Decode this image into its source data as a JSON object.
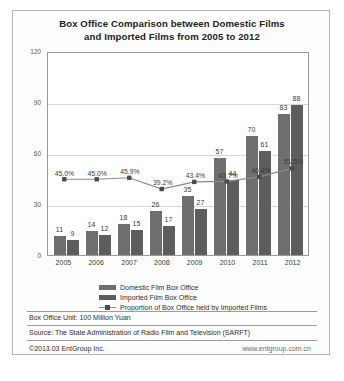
{
  "chart_data": {
    "type": "bar",
    "title": "Box Office Comparison between Domestic Films and Imported Films from 2005 to 2012",
    "title_line1": "Box Office Comparison between Domestic Films",
    "title_line2": "and Imported Films from 2005 to 2012",
    "categories": [
      "2005",
      "2006",
      "2007",
      "2008",
      "2009",
      "2010",
      "2011",
      "2012"
    ],
    "series": [
      {
        "name": "Domestic Film Box Office",
        "type": "bar",
        "values": [
          11,
          14,
          18,
          26,
          35,
          57,
          70,
          83
        ],
        "color": "#6f6f6f"
      },
      {
        "name": "Imported Film Box Office",
        "type": "bar",
        "values": [
          9,
          12,
          15,
          17,
          27,
          44,
          61,
          88
        ],
        "color": "#5d5d5d"
      },
      {
        "name": "Proportion of Box Office held by Imported Films",
        "type": "line",
        "values": [
          45.0,
          45.0,
          45.9,
          39.2,
          43.4,
          43.7,
          46.4,
          51.5
        ],
        "labels": [
          "45.0%",
          "45.0%",
          "45.9%",
          "39.2%",
          "43.4%",
          "43.7%",
          "46.4%",
          "51.5%"
        ],
        "color": "#8a8a8a"
      }
    ],
    "xlabel": "",
    "ylabel": "",
    "ylim": [
      0,
      120
    ],
    "yticks": [
      "0",
      "30",
      "60",
      "90",
      "120"
    ],
    "grid": true,
    "legend_position": "bottom"
  },
  "footer": {
    "unit": "Box Office Unit: 100 Million Yuan",
    "source": "Source: The State Administration of Radio Film and Television (SARFT)",
    "copyright": "©2013.03  EntGroup Inc.",
    "website": "www.entgroup.com.cn"
  }
}
